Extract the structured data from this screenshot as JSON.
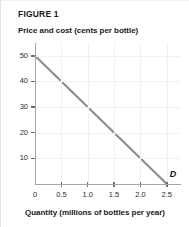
{
  "figure": {
    "label": "FIGURE 1"
  },
  "chart_data": {
    "type": "line",
    "title": "FIGURE 1",
    "xlabel": "Quantity (millions of bottles per year)",
    "ylabel": "Price and cost (cents per bottle)",
    "xlim": [
      0,
      2.75
    ],
    "ylim": [
      0,
      55
    ],
    "grid": true,
    "legend_position": "inline-endpoint",
    "xticks": [
      "0",
      "0.5",
      "1.0",
      "1.5",
      "2.0",
      "2.5"
    ],
    "xtick_values": [
      0,
      0.5,
      1.0,
      1.5,
      2.0,
      2.5
    ],
    "yticks": [
      "50",
      "40",
      "30",
      "20",
      "10"
    ],
    "ytick_values": [
      50,
      40,
      30,
      20,
      10
    ],
    "series": [
      {
        "name": "D",
        "label": "D",
        "color": "#8c8c8c",
        "x": [
          0,
          2.5
        ],
        "values": [
          50,
          0
        ],
        "points": [
          {
            "x": 0,
            "y": 50
          },
          {
            "x": 0.5,
            "y": 40
          },
          {
            "x": 1.0,
            "y": 30
          },
          {
            "x": 1.5,
            "y": 20
          },
          {
            "x": 2.0,
            "y": 10
          },
          {
            "x": 2.5,
            "y": 0
          }
        ],
        "annotation": "D"
      }
    ]
  }
}
